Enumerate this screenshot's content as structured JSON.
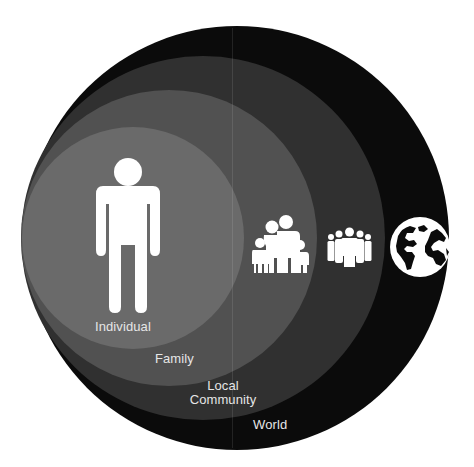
{
  "diagram": {
    "type": "nested-circles",
    "colors": {
      "background": "#ffffff",
      "individual": "#6a6a6a",
      "family": "#515151",
      "community": "#303030",
      "world": "#0b0b0b",
      "icon": "#ffffff",
      "label": "#e6e6e6"
    },
    "circles": [
      {
        "id": "world",
        "label": "World",
        "icon": "globe-icon",
        "cx": 237,
        "cy": 238,
        "r": 212
      },
      {
        "id": "community",
        "label_line1": "Local",
        "label_line2": "Community",
        "icon": "crowd-icon",
        "cx": 203,
        "cy": 238,
        "r": 182
      },
      {
        "id": "family",
        "label": "Family",
        "icon": "family-icon",
        "cx": 169,
        "cy": 238,
        "r": 148
      },
      {
        "id": "individual",
        "label": "Individual",
        "icon": "person-icon",
        "cx": 133,
        "cy": 238,
        "r": 111
      }
    ],
    "labels": {
      "individual": "Individual",
      "family": "Family",
      "community_line1": "Local",
      "community_line2": "Community",
      "world": "World"
    }
  }
}
